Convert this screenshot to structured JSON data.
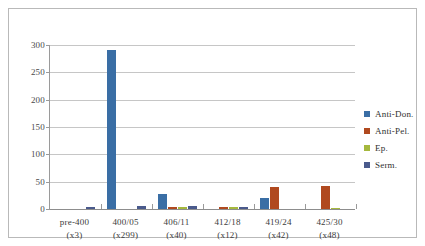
{
  "chart_data": {
    "type": "bar",
    "title": "",
    "subtitle": "",
    "xlabel": "",
    "ylabel": "",
    "grid": true,
    "legend_position": "right",
    "ylim": [
      0,
      300
    ],
    "yticks": [
      0,
      50,
      100,
      150,
      200,
      250,
      300
    ],
    "ytick_labels": [
      "0",
      "50",
      "100",
      "150",
      "200",
      "250",
      "300"
    ],
    "categories": [
      "pre-400",
      "400/05",
      "406/11",
      "412/18",
      "419/24",
      "425/30"
    ],
    "category_sublabels": [
      "(x3)",
      "(x299)",
      "(x40)",
      "(x12)",
      "(x42)",
      "(x48)"
    ],
    "series": [
      {
        "name": "Anti-Don.",
        "color": "#3a6ea5",
        "values": [
          0,
          290,
          28,
          0,
          20,
          0
        ]
      },
      {
        "name": "Anti-Pel.",
        "color": "#b0491f",
        "values": [
          0,
          0,
          3,
          3,
          40,
          43
        ]
      },
      {
        "name": "Ep.",
        "color": "#a5b83d",
        "values": [
          0,
          0,
          3,
          3,
          0,
          2
        ]
      },
      {
        "name": "Serm.",
        "color": "#4a5a8c",
        "values": [
          3,
          6,
          5,
          4,
          0,
          0
        ]
      }
    ]
  },
  "legend": {
    "items": [
      {
        "label": "Anti-Don.",
        "color": "#3a6ea5"
      },
      {
        "label": "Anti-Pel.",
        "color": "#b0491f"
      },
      {
        "label": "Ep.",
        "color": "#a5b83d"
      },
      {
        "label": "Serm.",
        "color": "#4a5a8c"
      }
    ]
  },
  "axes": {
    "y_tick_labels": [
      "300",
      "250",
      "200",
      "150",
      "100",
      "50",
      "0"
    ]
  }
}
